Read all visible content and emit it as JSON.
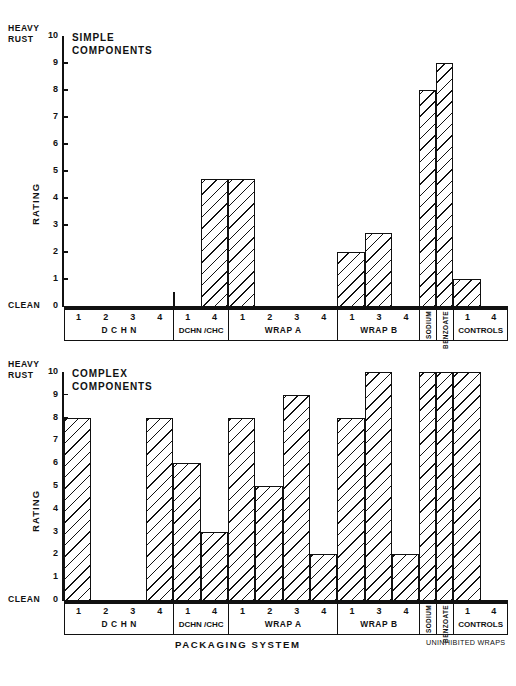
{
  "figure": {
    "axis_title": "PACKAGING   SYSTEM",
    "uninhibited_note": "UNINHIBITED WRAPS",
    "y_axis_label": "RATING",
    "y_top_label_line1": "HEAVY",
    "y_top_label_line2": "RUST",
    "y_zero_label": "CLEAN",
    "y_ticks": [
      "10",
      "9",
      "8",
      "7",
      "6",
      "5",
      "4",
      "3",
      "2",
      "1",
      "0"
    ],
    "ink_color": "#111111",
    "background_color": "#ffffff"
  },
  "groups": [
    {
      "name": "D C H N",
      "items": [
        "1",
        "2",
        "3",
        "4"
      ],
      "width": 4,
      "style": "wide"
    },
    {
      "name": "DCHN /CHC",
      "items": [
        "1",
        "4"
      ],
      "width": 2,
      "style": "tight"
    },
    {
      "name": "WRAP A",
      "items": [
        "1",
        "2",
        "3",
        "4"
      ],
      "width": 4,
      "style": "wide"
    },
    {
      "name": "WRAP B",
      "items": [
        "1",
        "3",
        "4"
      ],
      "width": 3,
      "style": "wide"
    },
    {
      "name": "SODIUM",
      "items": [],
      "width": 0.62,
      "style": "narrow"
    },
    {
      "name": "BENZOATE",
      "items": [],
      "width": 0.62,
      "style": "narrow"
    },
    {
      "name": "CONTROLS",
      "items": [
        "1",
        "4"
      ],
      "width": 2,
      "style": "tight"
    }
  ],
  "chart_data": [
    {
      "type": "bar",
      "title": "SIMPLE COMPONENTS",
      "title_lines": [
        "SIMPLE",
        "COMPONENTS"
      ],
      "xlabel": "PACKAGING   SYSTEM",
      "ylabel": "RATING",
      "ylim": [
        0,
        10
      ],
      "yticks": [
        0,
        1,
        2,
        3,
        4,
        5,
        6,
        7,
        8,
        9,
        10
      ],
      "ytick_top_annotation": "HEAVY RUST",
      "ytick_bottom_annotation": "CLEAN",
      "grid": false,
      "legend": "none",
      "categories": [
        "DCHN 1",
        "DCHN 2",
        "DCHN 3",
        "DCHN 4",
        "DCHN/CHC 1",
        "DCHN/CHC 4",
        "WRAP A 1",
        "WRAP A 2",
        "WRAP A 3",
        "WRAP A 4",
        "WRAP B 1",
        "WRAP B 3",
        "WRAP B 4",
        "SODIUM BENZOATE",
        "CONTROLS 1",
        "CONTROLS 4"
      ],
      "values": [
        0,
        0,
        0,
        0,
        0,
        4.7,
        4.7,
        0,
        0,
        0,
        2.0,
        2.7,
        0,
        8.0,
        9.0,
        1.0
      ]
    },
    {
      "type": "bar",
      "title": "COMPLEX COMPONENTS",
      "title_lines": [
        "COMPLEX",
        "COMPONENTS"
      ],
      "xlabel": "PACKAGING   SYSTEM",
      "ylabel": "RATING",
      "ylim": [
        0,
        10
      ],
      "yticks": [
        0,
        1,
        2,
        3,
        4,
        5,
        6,
        7,
        8,
        9,
        10
      ],
      "ytick_top_annotation": "HEAVY RUST",
      "ytick_bottom_annotation": "CLEAN",
      "grid": false,
      "legend": "none",
      "categories": [
        "DCHN 1",
        "DCHN 2",
        "DCHN 3",
        "DCHN 4",
        "DCHN/CHC 1",
        "DCHN/CHC 4",
        "WRAP A 1",
        "WRAP A 2",
        "WRAP A 3",
        "WRAP A 4",
        "WRAP B 1",
        "WRAP B 3",
        "WRAP B 4",
        "SODIUM BENZOATE",
        "CONTROLS 1",
        "CONTROLS 4"
      ],
      "values": [
        8,
        0,
        0,
        8,
        6,
        3,
        8,
        5,
        9,
        2,
        8,
        10,
        2,
        10,
        10,
        10
      ]
    }
  ]
}
